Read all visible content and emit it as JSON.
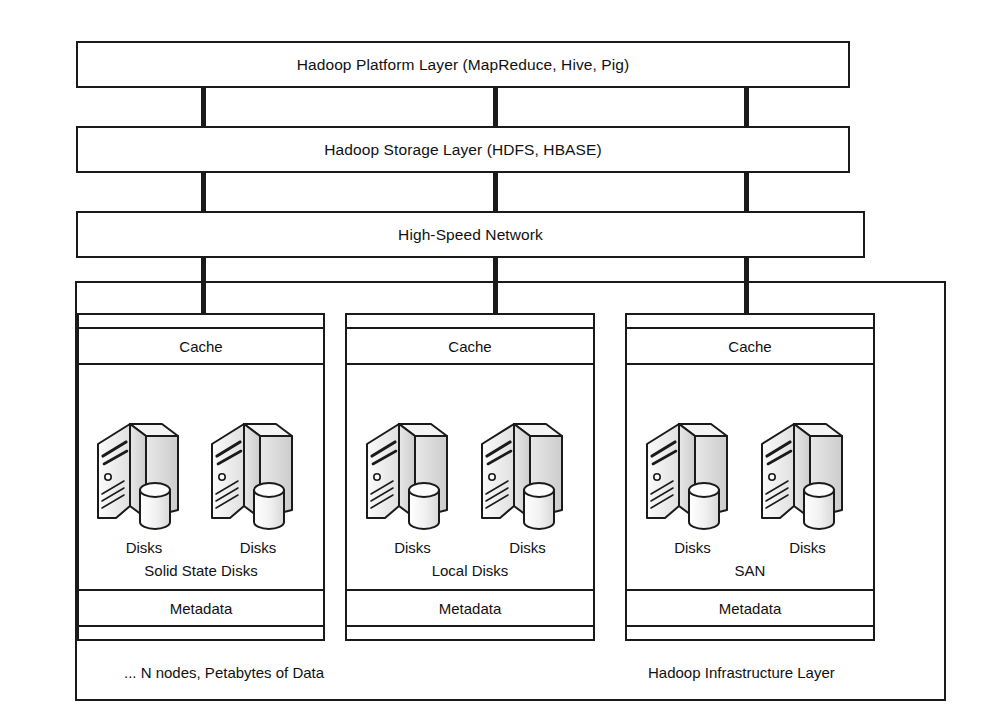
{
  "diagram": {
    "stack_layers": [
      {
        "id": "platform",
        "label": "Hadoop Platform Layer (MapReduce, Hive, Pig)"
      },
      {
        "id": "storage",
        "label": "Hadoop Storage Layer (HDFS, HBASE)"
      },
      {
        "id": "network",
        "label": "High-Speed Network"
      }
    ],
    "node_groups": [
      {
        "id": "ssd",
        "cache_label": "Cache",
        "storage_kind": "Solid State Disks",
        "metadata_label": "Metadata",
        "servers": [
          {
            "disks_label": "Disks"
          },
          {
            "disks_label": "Disks"
          }
        ]
      },
      {
        "id": "local",
        "cache_label": "Cache",
        "storage_kind": "Local Disks",
        "metadata_label": "Metadata",
        "servers": [
          {
            "disks_label": "Disks"
          },
          {
            "disks_label": "Disks"
          }
        ]
      },
      {
        "id": "san",
        "cache_label": "Cache",
        "storage_kind": "SAN",
        "metadata_label": "Metadata",
        "servers": [
          {
            "disks_label": "Disks"
          },
          {
            "disks_label": "Disks"
          }
        ]
      }
    ],
    "captions": {
      "nodes_note": "... N nodes, Petabytes of Data",
      "infrastructure_layer": "Hadoop Infrastructure Layer"
    },
    "colors": {
      "stroke": "#1a1a1a",
      "background": "#ffffff",
      "text": "#111111",
      "server_face_light": "#f2f2f2",
      "server_face_mid": "#e3e3e3",
      "server_face_dark": "#d4d4d4"
    }
  }
}
